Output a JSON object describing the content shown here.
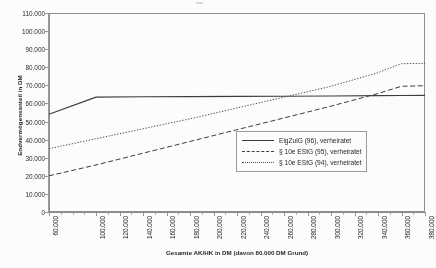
{
  "chart_data": {
    "type": "line",
    "title": "",
    "xlabel": "Gesamte AK/HK in DM (davon 80.000 DM Grund)",
    "ylabel": "Endvermögensanteil in DM",
    "xlim": [
      60000,
      380000
    ],
    "ylim": [
      0,
      110000
    ],
    "grid": false,
    "legend_position": "center-right",
    "x_ticks": [
      "60.000",
      "100.000",
      "120.000",
      "140.000",
      "160.000",
      "180.000",
      "200.000",
      "220.000",
      "240.000",
      "260.000",
      "280.000",
      "300.000",
      "320.000",
      "340.000",
      "360.000",
      "380.000"
    ],
    "x_tick_values": [
      60000,
      100000,
      120000,
      140000,
      160000,
      180000,
      200000,
      220000,
      240000,
      260000,
      280000,
      300000,
      320000,
      340000,
      360000,
      380000
    ],
    "y_ticks": [
      "0",
      "10.000",
      "20.000",
      "30.000",
      "40.000",
      "50.000",
      "60.000",
      "70.000",
      "80.000",
      "90.000",
      "100.000",
      "110.000"
    ],
    "y_tick_values": [
      0,
      10000,
      20000,
      30000,
      40000,
      50000,
      60000,
      70000,
      80000,
      90000,
      100000,
      110000
    ],
    "x": [
      60000,
      100000,
      140000,
      180000,
      220000,
      260000,
      300000,
      340000,
      360000,
      380000
    ],
    "series": [
      {
        "name": "EigZulG (96), verheiratet",
        "style": "solid",
        "color": "#3a3a3a",
        "values": [
          54000,
          63500,
          63700,
          63800,
          63900,
          64000,
          64100,
          64300,
          64400,
          64500
        ]
      },
      {
        "name": "§ 10e EStG (95), verheiratet",
        "style": "dashed",
        "color": "#3a3a3a",
        "values": [
          20000,
          26000,
          32500,
          39000,
          45500,
          52000,
          58500,
          65500,
          69500,
          69800
        ]
      },
      {
        "name": "§ 10e EStG (94), verheiratet",
        "style": "dotted",
        "color": "#4a4a4a",
        "values": [
          35000,
          40500,
          46000,
          51500,
          57500,
          63500,
          69500,
          77000,
          82000,
          82100
        ]
      }
    ]
  },
  "legend": {
    "items": [
      {
        "label": "EigZulG (96), verheiratet"
      },
      {
        "label": "§ 10e EStG (95), verheiratet"
      },
      {
        "label": "§ 10e EStG (94), verheiratet"
      }
    ]
  }
}
